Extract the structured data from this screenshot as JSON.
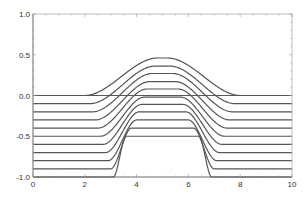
{
  "chart_data": {
    "type": "line",
    "title": "",
    "xlabel": "",
    "ylabel": "",
    "xlim": [
      0,
      10
    ],
    "ylim": [
      -1.0,
      1.0
    ],
    "grid": false,
    "legend": null,
    "x_ticks": [
      "0",
      "2",
      "4",
      "6",
      "8",
      "10"
    ],
    "y_ticks": [
      "1.0",
      "0.5",
      "0.0",
      "-0.5",
      "-1.0"
    ],
    "reference_line": {
      "y": 0.0
    },
    "series_description": "11 curves with flat baselines at 0.0, -0.1, ..., -1.0 rising to a bump centered at x=5; bump becomes more plateau-like and steeper as the baseline decreases",
    "series": [
      {
        "name": "curve-0",
        "baseline": 0.0,
        "peak": 0.46,
        "rise_start": 2.0,
        "rise_end": 4.8,
        "fall_start": 5.2,
        "fall_end": 8.0
      },
      {
        "name": "curve-1",
        "baseline": -0.1,
        "peak": 0.36,
        "rise_start": 2.2,
        "rise_end": 4.7,
        "fall_start": 5.3,
        "fall_end": 7.8
      },
      {
        "name": "curve-2",
        "baseline": -0.2,
        "peak": 0.27,
        "rise_start": 2.3,
        "rise_end": 4.6,
        "fall_start": 5.4,
        "fall_end": 7.7
      },
      {
        "name": "curve-3",
        "baseline": -0.3,
        "peak": 0.17,
        "rise_start": 2.4,
        "rise_end": 4.5,
        "fall_start": 5.5,
        "fall_end": 7.6
      },
      {
        "name": "curve-4",
        "baseline": -0.4,
        "peak": 0.08,
        "rise_start": 2.5,
        "rise_end": 4.4,
        "fall_start": 5.6,
        "fall_end": 7.5
      },
      {
        "name": "curve-5",
        "baseline": -0.5,
        "peak": -0.02,
        "rise_start": 2.6,
        "rise_end": 4.3,
        "fall_start": 5.7,
        "fall_end": 7.4
      },
      {
        "name": "curve-6",
        "baseline": -0.6,
        "peak": -0.11,
        "rise_start": 2.7,
        "rise_end": 4.2,
        "fall_start": 5.8,
        "fall_end": 7.3
      },
      {
        "name": "curve-7",
        "baseline": -0.7,
        "peak": -0.2,
        "rise_start": 2.8,
        "rise_end": 4.1,
        "fall_start": 5.9,
        "fall_end": 7.2
      },
      {
        "name": "curve-8",
        "baseline": -0.8,
        "peak": -0.3,
        "rise_start": 2.9,
        "rise_end": 4.0,
        "fall_start": 6.0,
        "fall_end": 7.1
      },
      {
        "name": "curve-9",
        "baseline": -0.9,
        "peak": -0.4,
        "rise_start": 3.0,
        "rise_end": 3.8,
        "fall_start": 6.2,
        "fall_end": 7.0
      },
      {
        "name": "curve-10",
        "baseline": -1.0,
        "peak": -0.5,
        "rise_start": 3.1,
        "rise_end": 3.6,
        "fall_start": 6.4,
        "fall_end": 6.9
      }
    ],
    "colors": {
      "line": "#555555",
      "axis": "#999999",
      "text": "#333333"
    }
  }
}
